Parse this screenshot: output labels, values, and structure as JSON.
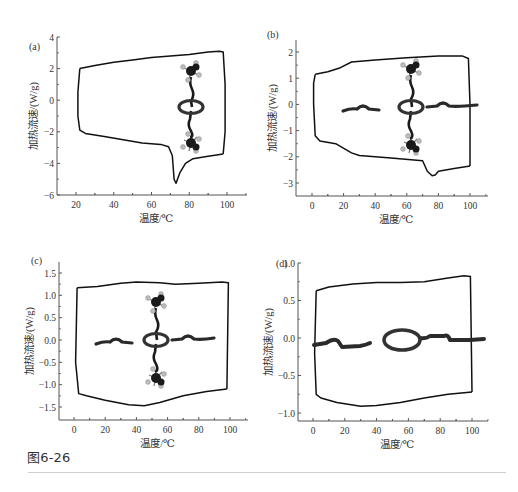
{
  "figure": {
    "caption": "图6-26"
  },
  "chart_data": [
    {
      "panel": "(a)",
      "type": "line",
      "xlabel": "温度/℃",
      "ylabel": "加热流速/(W/g)",
      "xlim": [
        10,
        110
      ],
      "ylim": [
        -6,
        4
      ],
      "xticks": [
        20,
        40,
        60,
        80,
        100
      ],
      "yticks": [
        4,
        2,
        0,
        -2,
        -4,
        -6
      ],
      "grid": false,
      "molecule": "rotaxane-vertical-with-ring",
      "series": [
        {
          "name": "heating",
          "x": [
            22,
            30,
            40,
            50,
            60,
            70,
            80,
            90,
            96,
            98,
            99,
            99,
            98
          ],
          "y": [
            2.0,
            2.2,
            2.4,
            2.55,
            2.7,
            2.8,
            2.9,
            3.05,
            3.1,
            3.05,
            1.0,
            -2.0,
            -3.4
          ]
        },
        {
          "name": "cooling",
          "x": [
            98,
            90,
            82,
            78,
            75,
            73,
            72,
            71,
            69,
            65,
            55,
            45,
            35,
            25,
            22,
            21,
            21,
            22
          ],
          "y": [
            -3.4,
            -3.55,
            -3.7,
            -4.0,
            -4.6,
            -5.25,
            -5.0,
            -3.5,
            -2.95,
            -2.8,
            -2.7,
            -2.5,
            -2.3,
            -2.1,
            -1.9,
            -1.0,
            0.5,
            2.0
          ]
        }
      ]
    },
    {
      "panel": "(b)",
      "type": "line",
      "xlabel": "温度/℃",
      "ylabel": "加热流速/(W/g)",
      "xlim": [
        -10,
        110
      ],
      "ylim": [
        -3.5,
        2.5
      ],
      "xticks": [
        0,
        20,
        40,
        60,
        80,
        100
      ],
      "yticks": [
        2,
        1,
        0,
        -1,
        -2,
        -3
      ],
      "grid": false,
      "molecule": "rotaxane-cross-with-ring",
      "series": [
        {
          "name": "heating",
          "x": [
            2,
            10,
            18,
            25,
            40,
            60,
            80,
            95,
            99,
            100,
            100
          ],
          "y": [
            1.15,
            1.25,
            1.4,
            1.62,
            1.7,
            1.78,
            1.85,
            1.85,
            1.75,
            0.0,
            -2.35
          ]
        },
        {
          "name": "cooling",
          "x": [
            100,
            90,
            80,
            78,
            76,
            73,
            70,
            50,
            30,
            25,
            15,
            5,
            2,
            1,
            1,
            2
          ],
          "y": [
            -2.35,
            -2.45,
            -2.55,
            -2.7,
            -2.72,
            -2.55,
            -2.15,
            -2.05,
            -1.95,
            -1.85,
            -1.5,
            -1.4,
            -1.2,
            0.0,
            0.8,
            1.15
          ]
        }
      ]
    },
    {
      "panel": "(c)",
      "type": "line",
      "xlabel": "温度/℃",
      "ylabel": "加热流速/(W/g)",
      "xlim": [
        -10,
        110
      ],
      "ylim": [
        -1.75,
        1.75
      ],
      "xticks": [
        0,
        20,
        40,
        60,
        80,
        100
      ],
      "yticks": [
        1.5,
        1.0,
        0.5,
        0.0,
        -0.5,
        -1.0,
        -1.5
      ],
      "grid": false,
      "molecule": "rotaxane-cross-with-ring",
      "series": [
        {
          "name": "heating",
          "x": [
            2,
            15,
            30,
            40,
            55,
            65,
            80,
            95,
            99,
            98
          ],
          "y": [
            1.17,
            1.2,
            1.27,
            1.3,
            1.28,
            1.25,
            1.27,
            1.3,
            1.28,
            -1.1
          ]
        },
        {
          "name": "cooling",
          "x": [
            98,
            85,
            70,
            55,
            45,
            35,
            20,
            8,
            3,
            1,
            2
          ],
          "y": [
            -1.1,
            -1.15,
            -1.25,
            -1.4,
            -1.47,
            -1.45,
            -1.35,
            -1.25,
            -1.2,
            -0.5,
            1.17
          ]
        }
      ]
    },
    {
      "panel": "(d)",
      "type": "line",
      "xlabel": "温度/℃",
      "ylabel": "加热流速/(W/g)",
      "xlim": [
        -10,
        110
      ],
      "ylim": [
        -1.05,
        1.0
      ],
      "xticks": [
        0,
        20,
        40,
        60,
        80,
        100
      ],
      "yticks": [
        1.0,
        0.5,
        0.0,
        -0.5,
        -1.0
      ],
      "grid": false,
      "molecule": "ring-on-axle-horizontal",
      "series": [
        {
          "name": "heating",
          "x": [
            2,
            10,
            25,
            40,
            55,
            70,
            85,
            95,
            99,
            100
          ],
          "y": [
            0.63,
            0.68,
            0.72,
            0.74,
            0.74,
            0.75,
            0.8,
            0.83,
            0.82,
            -0.72
          ]
        },
        {
          "name": "cooling",
          "x": [
            100,
            85,
            70,
            55,
            40,
            30,
            15,
            5,
            2,
            1,
            2
          ],
          "y": [
            -0.72,
            -0.75,
            -0.8,
            -0.86,
            -0.9,
            -0.91,
            -0.86,
            -0.8,
            -0.75,
            -0.2,
            0.63
          ]
        }
      ]
    }
  ],
  "layout": {
    "panels": [
      {
        "axis_x0": 57,
        "axis_y0": 195,
        "axis_xend": 247,
        "axis_ytop": 37,
        "xpx": [
          76,
          227
        ],
        "xval": [
          20,
          100
        ],
        "ypx": [
          37,
          195
        ],
        "yval": [
          4,
          -6
        ],
        "label_pos": [
          29,
          50
        ],
        "mol_cx": 191,
        "mol_cy": 107
      },
      {
        "axis_x0": 296,
        "axis_y0": 196,
        "axis_xend": 488,
        "axis_ytop": 40,
        "xpx": [
          312,
          470
        ],
        "xval": [
          0,
          100
        ],
        "ypx": [
          52,
          183
        ],
        "yval": [
          2,
          -3
        ],
        "label_pos": [
          267,
          38
        ],
        "mol_cx": 411,
        "mol_cy": 107
      },
      {
        "axis_x0": 59,
        "axis_y0": 420,
        "axis_xend": 248,
        "axis_ytop": 262,
        "xpx": [
          74,
          230
        ],
        "xval": [
          0,
          100
        ],
        "ypx": [
          273,
          407
        ],
        "yval": [
          1.5,
          -1.5
        ],
        "label_pos": [
          31,
          264
        ],
        "mol_cx": 156,
        "mol_cy": 340
      },
      {
        "axis_x0": 298,
        "axis_y0": 421,
        "axis_xend": 488,
        "axis_ytop": 263,
        "xpx": [
          313,
          472
        ],
        "xval": [
          0,
          100
        ],
        "ypx": [
          263,
          413
        ],
        "yval": [
          1.0,
          -1.0
        ],
        "label_pos": [
          276,
          267
        ],
        "mol_cx": 402,
        "mol_cy": 340
      }
    ]
  },
  "colors": {
    "curve": "#111111",
    "axis": "#555555",
    "molecule_dark": "#1a1a1a",
    "molecule_light": "#bdbdbd",
    "rule": "#cfcfcf"
  }
}
